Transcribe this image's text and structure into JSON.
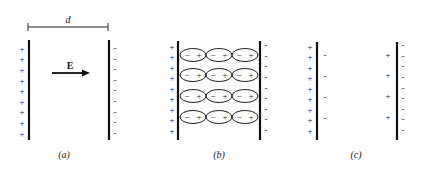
{
  "figure": {
    "panels": [
      {
        "id": "a",
        "caption": "(a)",
        "dimension_label": "d",
        "field_label": "E",
        "left_plate_charge": "+",
        "right_plate_charge": "−",
        "left_plate_sign_count": 9,
        "right_plate_sign_count": 9,
        "description": "Parallel-plate capacitor with vacuum; uniform field E pointing from + plate to − plate, separation d"
      },
      {
        "id": "b",
        "caption": "(b)",
        "left_plate_charge": "+",
        "right_plate_charge": "−",
        "left_plate_sign_count": 9,
        "right_plate_sign_count": 9,
        "dipole_rows": 4,
        "dipole_columns": 3,
        "dipole_labels": [
          "−",
          "+"
        ],
        "description": "Dielectric inserted; polarized molecules shown as ellipses with − toward + plate and + toward − plate"
      },
      {
        "id": "c",
        "caption": "(c)",
        "left_plate_charge": "+",
        "right_plate_charge": "−",
        "left_plate_sign_count": 9,
        "right_plate_sign_count": 9,
        "induced_left_surface": "−",
        "induced_right_surface": "+",
        "induced_count": 4,
        "description": "Net effect: induced surface charges on dielectric faces adjacent to plates"
      }
    ]
  }
}
